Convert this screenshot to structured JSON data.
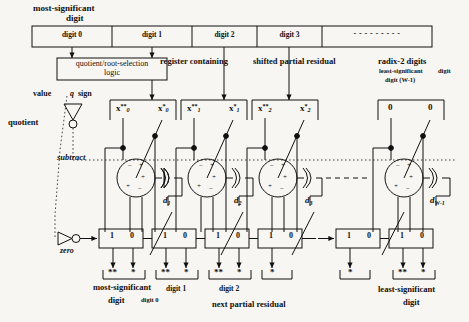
{
  "figure": {
    "title_top_left": "most-significant",
    "title_top_left2": "digit",
    "register_note": "register containing",
    "register_note2": "shifted partial residual",
    "radix_note": "radix-2 digits",
    "lsd_note": "least-significant",
    "lsd_note2": "digit (W-1)",
    "digit_note": "digit",
    "selection_logic": "quotient/root-selection",
    "selection_logic2": "logic",
    "value_label": "value",
    "q_label": "q",
    "sign_label": "sign",
    "quotient_label": "quotient",
    "subtract_label": "subtract",
    "zero_label": "zero",
    "next_residual": "next partial residual",
    "msd_out": "most-significant",
    "msd_out2": "digit",
    "lsd_out": "least-significant",
    "lsd_out2": "digit"
  },
  "register_cells": [
    {
      "label": "digit 0"
    },
    {
      "label": "digit 1"
    },
    {
      "label": "digit 2"
    },
    {
      "label": "digit 3"
    },
    {
      "label": "- - - - - - - - -"
    }
  ],
  "operand_boxes": [
    {
      "left": "x",
      "left_sup": "**",
      "left_sub": "0",
      "right": "x",
      "right_sup": "*",
      "right_sub": "0"
    },
    {
      "left": "x",
      "left_sup": "**",
      "left_sub": "1",
      "right": "x",
      "right_sup": "*",
      "right_sub": "1"
    },
    {
      "left": "x",
      "left_sup": "**",
      "left_sub": "2",
      "right": "x",
      "right_sup": "*",
      "right_sub": "2"
    },
    {
      "left": "0",
      "left_sup": "",
      "left_sub": "",
      "right": "0",
      "right_sup": "",
      "right_sub": ""
    }
  ],
  "adders": [
    {
      "d_label": "d",
      "d_sub": "1",
      "top_signs": [
        "−",
        "+",
        "+"
      ],
      "bot_signs": [
        "+",
        "−"
      ]
    },
    {
      "d_label": "d",
      "d_sub": "2",
      "top_signs": [
        "−",
        "+",
        "+"
      ],
      "bot_signs": [
        "+",
        "−"
      ]
    },
    {
      "d_label": "d",
      "d_sub": "3",
      "top_signs": [
        "−",
        "+",
        "+"
      ],
      "bot_signs": [
        "+",
        "−"
      ]
    },
    {
      "d_label": "d",
      "d_sub": "W-1",
      "top_signs": [
        "−",
        "+",
        "+"
      ],
      "bot_signs": [
        "+",
        "−"
      ]
    }
  ],
  "mux_row": {
    "one": "1",
    "zero": "0",
    "count": 7
  },
  "output_groups": [
    {
      "marks": [
        "**",
        "*"
      ],
      "caption": "most-significant",
      "caption2": "digit",
      "sub_caption": "digit 0"
    },
    {
      "marks": [
        "**",
        "*"
      ],
      "caption": "",
      "caption2": "",
      "sub_caption": "digit 1"
    },
    {
      "marks": [
        "**",
        "*"
      ],
      "caption": "",
      "caption2": "",
      "sub_caption": "digit 2"
    },
    {
      "marks": [
        "*"
      ],
      "caption": "",
      "caption2": "",
      "sub_caption": ""
    },
    {
      "marks": [
        "**",
        "*"
      ],
      "caption": "least-significant",
      "caption2": "digit",
      "sub_caption": ""
    }
  ],
  "ellipsis": {
    "mid": "– – – – – –",
    "mux": "—"
  },
  "colors": {
    "ink": "#111111",
    "paper": "#f7f6f3",
    "dotted": "#555555"
  }
}
